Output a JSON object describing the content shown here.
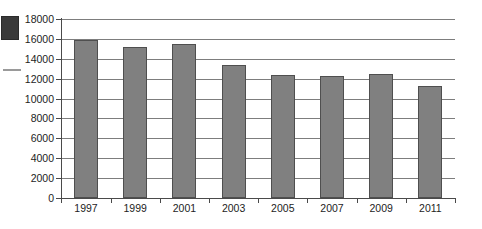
{
  "chart_data": {
    "type": "bar",
    "title": "",
    "subtitle": "",
    "xlabel": "",
    "ylabel": "",
    "categories": [
      "1997",
      "1999",
      "2001",
      "2003",
      "2005",
      "2007",
      "2009",
      "2011"
    ],
    "values": [
      15900,
      15200,
      15450,
      13400,
      12400,
      12250,
      12450,
      11250
    ],
    "ylim": [
      0,
      18000
    ],
    "yticks": [
      0,
      2000,
      4000,
      6000,
      8000,
      10000,
      12000,
      14000,
      16000,
      18000
    ],
    "ytick_labels": [
      "0",
      "2000",
      "4000",
      "6000",
      "8000",
      "10000",
      "12000",
      "14000",
      "16000",
      "18000"
    ],
    "grid": true,
    "grid_axis": "y",
    "legend": false,
    "legend_position": "none",
    "series": [
      {
        "name": "",
        "color": "#808080",
        "values": [
          15900,
          15200,
          15450,
          13400,
          12400,
          12250,
          12450,
          11250
        ]
      }
    ],
    "annotations": []
  },
  "figure": {
    "background_color": "#ffffff",
    "bar_fill_color": "#808080",
    "bar_edge_color": "#4f4f4f",
    "gridline_color": "#7d7d7d",
    "axis_color": "#4a4a4a",
    "tick_label_color": "#1d1d1d"
  },
  "artifacts": {
    "scan_block_label": "scan-artifact-block",
    "scan_dash_label": "scan-artifact-dash"
  }
}
